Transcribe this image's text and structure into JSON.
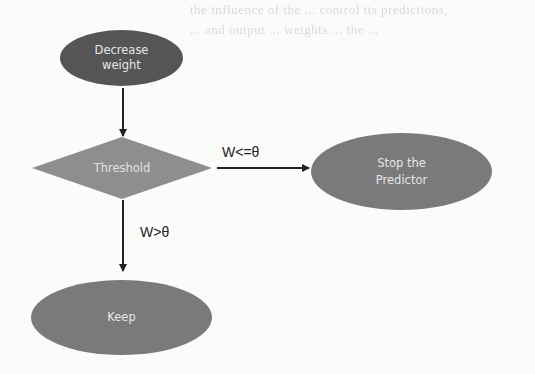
{
  "background_text": [
    "the influence of the ... control its predictions,",
    "... and output ... weights ... the ..."
  ],
  "diagram": {
    "nodes": {
      "decrease_weight": {
        "label_line1": "Decrease",
        "label_line2": "weight",
        "shape": "ellipse"
      },
      "threshold": {
        "label": "Threshold",
        "shape": "diamond"
      },
      "stop": {
        "label_line1": "Stop the",
        "label_line2": "Predictor",
        "shape": "ellipse"
      },
      "keep": {
        "label": "Keep",
        "shape": "ellipse"
      }
    },
    "edges": [
      {
        "from": "decrease_weight",
        "to": "threshold",
        "label": ""
      },
      {
        "from": "threshold",
        "to": "stop",
        "label": "W<=θ"
      },
      {
        "from": "threshold",
        "to": "keep",
        "label": "W>θ"
      }
    ],
    "colors": {
      "ellipse_fill_dark": "#555555",
      "ellipse_fill_mid": "#7a7a7a",
      "diamond_fill": "#8e8e8e",
      "node_text": "#e6e6e6",
      "edge": "#222222"
    }
  }
}
